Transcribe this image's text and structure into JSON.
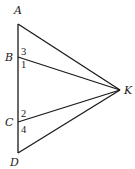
{
  "diagram": {
    "type": "geometry",
    "points": {
      "A": {
        "label": "A",
        "x": 18,
        "y": 24,
        "lx": 14,
        "ly": 14
      },
      "B": {
        "label": "B",
        "x": 18,
        "y": 57,
        "lx": 5,
        "ly": 61
      },
      "C": {
        "label": "C",
        "x": 18,
        "y": 122,
        "lx": 5,
        "ly": 126
      },
      "D": {
        "label": "D",
        "x": 18,
        "y": 153,
        "lx": 10,
        "ly": 166
      },
      "K": {
        "label": "K",
        "x": 120,
        "y": 90,
        "lx": 124,
        "ly": 94
      }
    },
    "segments": [
      {
        "from": "A",
        "to": "D",
        "name": "segment-AD"
      },
      {
        "from": "A",
        "to": "K",
        "name": "segment-AK"
      },
      {
        "from": "B",
        "to": "K",
        "name": "segment-BK"
      },
      {
        "from": "C",
        "to": "K",
        "name": "segment-CK"
      },
      {
        "from": "D",
        "to": "K",
        "name": "segment-DK"
      }
    ],
    "angle_labels": [
      {
        "label": "3",
        "x": 21,
        "y": 55,
        "name": "angle-3"
      },
      {
        "label": "1",
        "x": 21,
        "y": 68,
        "name": "angle-1"
      },
      {
        "label": "2",
        "x": 21,
        "y": 117,
        "name": "angle-2"
      },
      {
        "label": "4",
        "x": 21,
        "y": 133,
        "name": "angle-4"
      }
    ]
  }
}
